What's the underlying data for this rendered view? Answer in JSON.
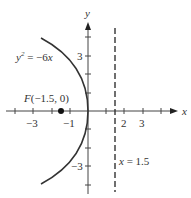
{
  "figure": {
    "type": "parabola-graph",
    "equation_label": "y² = −6x",
    "equation_lhs": "y",
    "equation_exp": "2",
    "equation_rhs": " = −6x",
    "focus": {
      "label": "F(−1.5, 0)",
      "x": -1.5,
      "y": 0
    },
    "directrix": {
      "label": "x = 1.5",
      "x": 1.5
    },
    "axes": {
      "x_label": "x",
      "y_label": "y",
      "x_ticks": [
        -4,
        -3,
        -2,
        -1,
        1,
        2,
        3,
        4
      ],
      "y_ticks": [
        -4,
        -3,
        -2,
        -1,
        1,
        2,
        3,
        4
      ],
      "x_tick_labels": [
        {
          "value": -3,
          "text": "−3"
        },
        {
          "value": -1,
          "text": "−1"
        },
        {
          "value": 2,
          "text": "2"
        },
        {
          "value": 3,
          "text": "3"
        }
      ],
      "y_tick_labels": [
        {
          "value": 3,
          "text": "3"
        },
        {
          "value": -3,
          "text": "−3"
        }
      ]
    },
    "colors": {
      "curve": "#333333",
      "axes": "#444444",
      "text": "#333333"
    }
  }
}
